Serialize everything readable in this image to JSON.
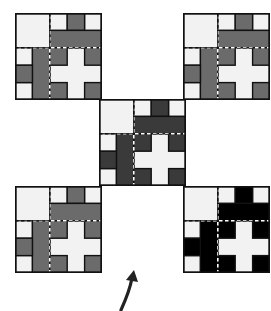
{
  "diagram": {
    "grid_size": 5,
    "cell_px": 17.4,
    "pieces": [
      {
        "x": 3,
        "y": 0,
        "w": 1,
        "h": 1
      },
      {
        "x": 2,
        "y": 1,
        "w": 3,
        "h": 1
      },
      {
        "x": 1,
        "y": 2,
        "w": 1,
        "h": 3
      },
      {
        "x": 0,
        "y": 3,
        "w": 1,
        "h": 1
      },
      {
        "x": 2,
        "y": 2,
        "w": 1,
        "h": 1
      },
      {
        "x": 2,
        "y": 4,
        "w": 1,
        "h": 1
      },
      {
        "x": 4,
        "y": 2,
        "w": 1,
        "h": 1
      },
      {
        "x": 4,
        "y": 4,
        "w": 1,
        "h": 1
      }
    ],
    "dashed_lines": {
      "vertical_at_col": 2,
      "horizontal_at_row": 2
    },
    "tiles": [
      {
        "id": "top-left",
        "left": 15,
        "top": 13,
        "fill": "#6b6b6b"
      },
      {
        "id": "top-right",
        "left": 183,
        "top": 13,
        "fill": "#6b6b6b"
      },
      {
        "id": "center",
        "left": 99,
        "top": 99,
        "fill": "#3a3a3a"
      },
      {
        "id": "bottom-left",
        "left": 15,
        "top": 186,
        "fill": "#6b6b6b"
      },
      {
        "id": "bottom-right",
        "left": 183,
        "top": 186,
        "fill": "#000000"
      }
    ],
    "colors": {
      "background": "#ffffff",
      "light_cell": "#f2f2f2",
      "outline": "#111111"
    },
    "arrow": {
      "direction": "up",
      "style": "curved",
      "color": "#222222"
    }
  }
}
